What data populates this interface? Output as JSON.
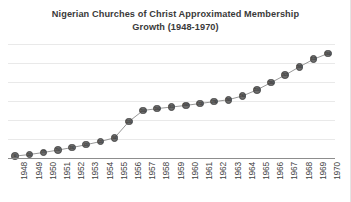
{
  "chart_data": {
    "type": "line",
    "title": "Nigerian Churches of Christ Approximated Membership Growth (1948-1970)",
    "title_lines": [
      "Nigerian Churches of Christ Approximated Membership",
      "Growth (1948-1970)"
    ],
    "xlabel": "",
    "ylabel": "",
    "categories": [
      "1948",
      "1949",
      "1950",
      "1951",
      "1952",
      "1953",
      "1954",
      "1955",
      "1956",
      "1957",
      "1958",
      "1959",
      "1960",
      "1961",
      "1962",
      "1963",
      "1964",
      "1965",
      "1966",
      "1967",
      "1968",
      "1969",
      "1970"
    ],
    "series": [
      {
        "name": "Approximated Membership",
        "values": [
          60,
          110,
          175,
          250,
          330,
          420,
          520,
          640,
          1150,
          1500,
          1560,
          1610,
          1660,
          1720,
          1780,
          1840,
          1960,
          2150,
          2380,
          2620,
          2880,
          3120,
          3300
        ]
      }
    ],
    "ylim": [
      0,
      3600
    ],
    "grid": true,
    "gridline_count": 7,
    "legend": "none",
    "legend_position": "none",
    "marker": "circle",
    "marker_color": "#6b6b6b",
    "line_color": "#8c8c8c",
    "gridline_color": "#e9e9e9",
    "axis_color": "#8d8d8d",
    "data_labels_visible": true,
    "y_axis_labels_visible": false,
    "x_label_rotation": 90,
    "background_color": "#ffffff"
  }
}
